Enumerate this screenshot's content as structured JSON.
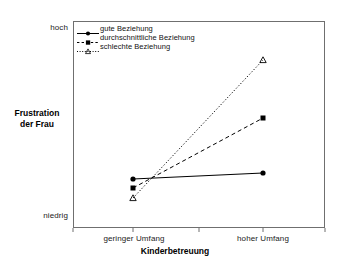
{
  "chart_data": {
    "type": "line",
    "title": "",
    "xlabel": "Kinderbetreuung",
    "ylabel": "Frustration der Frau",
    "ylabel_line1": "Frustration",
    "ylabel_line2": "der Frau",
    "categories": [
      "geringer Umfang",
      "hoher Umfang"
    ],
    "ytick_labels": [
      "hoch",
      "niedrig"
    ],
    "ylim_labels": {
      "low": "niedrig",
      "high": "hoch"
    },
    "grid": false,
    "legend_position": "top-left",
    "series": [
      {
        "name": "gute Beziehung",
        "marker": "filled-circle",
        "linestyle": "solid",
        "color": "#000000",
        "values": [
          0.237,
          0.266
        ],
        "points_px": [
          [
            133,
            179
          ],
          [
            263,
            173
          ]
        ]
      },
      {
        "name": "durchschnittliche Beziehung",
        "marker": "filled-square",
        "linestyle": "dashed",
        "color": "#000000",
        "values": [
          0.193,
          0.532
        ],
        "points_px": [
          [
            133,
            188
          ],
          [
            263,
            118
          ]
        ]
      },
      {
        "name": "schlechte Beziehung",
        "marker": "open-triangle",
        "linestyle": "dotted",
        "color": "#000000",
        "values": [
          0.145,
          0.812
        ],
        "points_px": [
          [
            133,
            198
          ],
          [
            263,
            60
          ]
        ]
      }
    ],
    "axes_px": {
      "left": 73,
      "top": 21,
      "right": 325,
      "bottom": 228
    },
    "xtick_px": [
      73,
      133,
      199,
      263,
      325
    ]
  },
  "colors": {
    "frame": "#6f6f6f",
    "ink": "#000000",
    "background": "#ffffff"
  }
}
